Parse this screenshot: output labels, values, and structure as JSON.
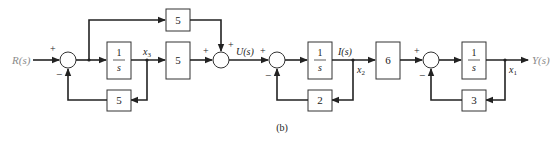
{
  "diagram": {
    "caption": "(b)",
    "input_label": "R(s)",
    "output_label": "Y(s)",
    "signals": {
      "x3": {
        "base": "x",
        "sub": "3"
      },
      "U": "U(s)",
      "I": "I(s)",
      "x2": {
        "base": "x",
        "sub": "2"
      },
      "x1": {
        "base": "x",
        "sub": "1"
      }
    },
    "blocks": {
      "integrator1": {
        "num": "1",
        "den": "s"
      },
      "feedforward_gain": "5",
      "output_gain_x3": "5",
      "feedback_gain_x3": "5",
      "integrator2": {
        "num": "1",
        "den": "s"
      },
      "feedback_gain_x2": "2",
      "gain_6": "6",
      "integrator3": {
        "num": "1",
        "den": "s"
      },
      "feedback_gain_x1": "3"
    },
    "signs": {
      "sum1_in": "+",
      "sum1_fb": "−",
      "sum2_left": "+",
      "sum2_top": "+",
      "sum3_in": "+",
      "sum3_fb": "−",
      "sum4_in": "+",
      "sum4_fb": "−"
    },
    "colors": {
      "line": "#222222",
      "label_gray": "#8a8a8a"
    }
  }
}
